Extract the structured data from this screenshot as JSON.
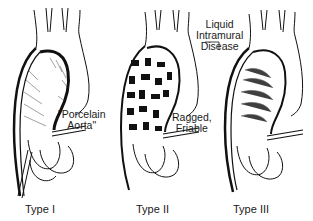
{
  "figure": {
    "panels": [
      {
        "caption": "Type I",
        "annotation": [
          "\"Porcelain",
          "Aorta\""
        ]
      },
      {
        "caption": "Type II",
        "annotation": [
          "Ragged,",
          "Friable"
        ]
      },
      {
        "caption": "Type III",
        "annotation": [
          "Liquid",
          "Intramural",
          "Disease"
        ]
      }
    ]
  },
  "colors": {
    "ink": "#111111",
    "background": "#ffffff"
  }
}
